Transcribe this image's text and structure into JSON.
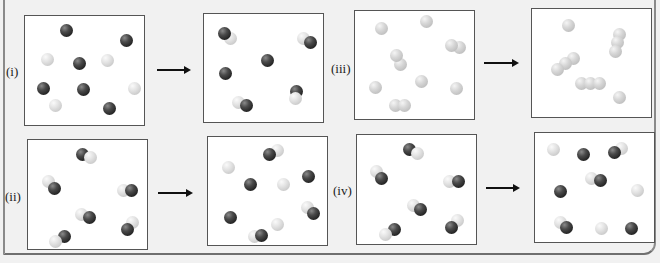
{
  "figure": {
    "arrow_symbol": "→",
    "colors": {
      "dark_atom": "#2a2a2a",
      "light_atom": "#d9d9d9",
      "grey_atom": "#cfcfcf",
      "box_border": "#555555",
      "background": "#f1f1f1"
    }
  },
  "panels": [
    {
      "id": "i",
      "label": "(i)",
      "before": "single dark and light atoms",
      "after": "light-dark diatomic molecules with leftover dark atoms"
    },
    {
      "id": "ii",
      "label": "(ii)",
      "before": "light-dark diatomic molecules",
      "after": "mixture of atoms and diatomic molecules"
    },
    {
      "id": "iii",
      "label": "(iii)",
      "before": "single grey atoms and grey diatomics",
      "after": "grey triatomic chains and single atoms"
    },
    {
      "id": "iv",
      "label": "(iv)",
      "before": "light-dark diatomic molecules",
      "after": "mixture of atoms and diatomic molecules"
    }
  ]
}
